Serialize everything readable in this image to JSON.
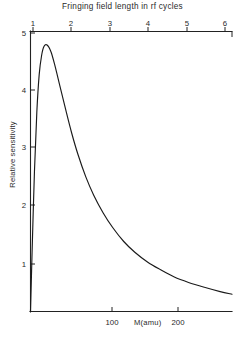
{
  "chart_data": {
    "type": "line",
    "title": "Fringing field length in rf cycles",
    "xlabel": "M(amu)",
    "ylabel": "Relative sensitivity",
    "grid": false,
    "legend": null,
    "axes": {
      "top": {
        "label": "Fringing field length in rf cycles",
        "ticks": [
          1,
          2,
          3,
          4,
          5,
          6
        ],
        "tick_labels": [
          "1",
          "2",
          "3",
          "4",
          "5",
          "6"
        ],
        "range": [
          0.6,
          6.25
        ]
      },
      "bottom": {
        "label": "M(amu)",
        "ticks": [
          100,
          200
        ],
        "tick_labels": [
          "100",
          "200"
        ],
        "range": [
          0,
          255
        ]
      },
      "left": {
        "label": "Relative sensitivity",
        "ticks": [
          1,
          2,
          3,
          4,
          5
        ],
        "tick_labels": [
          "1",
          "2",
          "3",
          "4",
          "5"
        ],
        "range": [
          0,
          5.2
        ]
      }
    },
    "series": [
      {
        "name": "Relative sensitivity",
        "x": [
          0,
          2,
          5,
          8,
          11,
          14,
          17,
          21,
          26,
          31,
          37,
          44,
          52,
          60,
          70,
          80,
          92,
          104,
          118,
          132,
          148,
          164,
          182,
          200,
          220,
          240,
          255
        ],
        "y": [
          0.0,
          1.1,
          2.6,
          3.7,
          4.4,
          4.75,
          4.92,
          4.95,
          4.82,
          4.56,
          4.2,
          3.78,
          3.32,
          2.92,
          2.5,
          2.16,
          1.83,
          1.56,
          1.3,
          1.1,
          0.92,
          0.78,
          0.64,
          0.54,
          0.45,
          0.37,
          0.32
        ]
      }
    ],
    "peak": {
      "x": 21,
      "y": 4.95
    }
  },
  "labels": {
    "top_title": "Fringing field length in rf cycles",
    "y_axis_title": "Relative sensitivity",
    "x_axis_caption": "M(amu)",
    "top_ticks": [
      "1",
      "2",
      "3",
      "4",
      "5",
      "6"
    ],
    "left_ticks": [
      "5",
      "4",
      "3",
      "2",
      "1"
    ],
    "bottom_ticks": [
      "100",
      "200"
    ]
  }
}
